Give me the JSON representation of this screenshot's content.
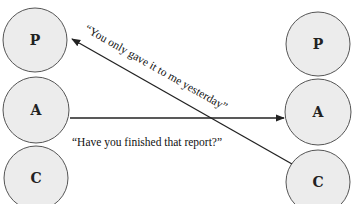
{
  "diagram": {
    "type": "transactional-analysis",
    "left_person": {
      "states": [
        {
          "label": "P",
          "cx": 35,
          "cy": 40,
          "r": 32
        },
        {
          "label": "A",
          "cx": 36,
          "cy": 110,
          "r": 33
        },
        {
          "label": "C",
          "cx": 36,
          "cy": 178,
          "r": 32
        }
      ]
    },
    "right_person": {
      "states": [
        {
          "label": "P",
          "cx": 318,
          "cy": 44,
          "r": 32
        },
        {
          "label": "A",
          "cx": 318,
          "cy": 112,
          "r": 33
        },
        {
          "label": "C",
          "cx": 318,
          "cy": 182,
          "r": 32
        }
      ]
    },
    "transactions": [
      {
        "from": "left.A",
        "to": "right.A",
        "text": "“Have you finished that report?”"
      },
      {
        "from": "right.C",
        "to": "left.P",
        "text": "“You only gave it to me yesterday”"
      }
    ],
    "colors": {
      "circle_fill": "#ececec",
      "circle_stroke": "#555555",
      "line": "#222222"
    }
  }
}
